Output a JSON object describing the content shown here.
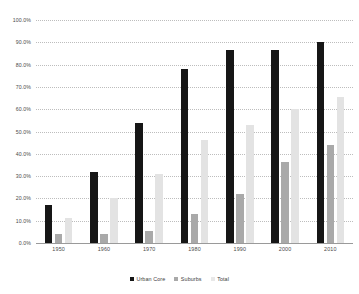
{
  "chart_data": {
    "type": "bar",
    "title": "",
    "subtitle": "",
    "xlabel": "",
    "ylabel": "",
    "categories": [
      "1950",
      "1960",
      "1970",
      "1980",
      "1990",
      "2000",
      "2010"
    ],
    "series": [
      {
        "name": "Urban Core",
        "color": "#161616",
        "values": [
          17.0,
          32.0,
          54.0,
          78.0,
          86.5,
          86.5,
          90.0
        ]
      },
      {
        "name": "Suburbs",
        "color": "#a9a9a9",
        "values": [
          4.0,
          4.0,
          5.5,
          13.0,
          22.0,
          36.5,
          44.0
        ]
      },
      {
        "name": "Total",
        "color": "#e3e3e3",
        "values": [
          11.0,
          20.0,
          31.0,
          46.0,
          53.0,
          60.0,
          65.5
        ]
      }
    ],
    "ylim": [
      0,
      100
    ],
    "ytick_values": [
      0,
      10,
      20,
      30,
      40,
      50,
      60,
      70,
      80,
      90,
      100
    ],
    "ytick_labels": [
      "0.0%",
      "10.0%",
      "20.0%",
      "30.0%",
      "40.0%",
      "50.0%",
      "60.0%",
      "70.0%",
      "80.0%",
      "90.0%",
      "100.0%"
    ],
    "grid": true,
    "grid_style": "dotted",
    "grid_color": "#bdbdbd",
    "legend_position": "bottom",
    "legend_entries": [
      "Urban Core",
      "Suburbs",
      "Total"
    ],
    "background_color": "#ffffff",
    "axis_text_color": "#4a4a4a"
  }
}
